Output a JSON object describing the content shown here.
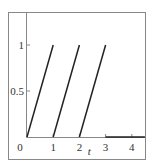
{
  "chart_data": {
    "type": "line",
    "title": "",
    "xlabel": "t",
    "ylabel": "",
    "xlim": [
      0,
      4.5
    ],
    "ylim": [
      0,
      1
    ],
    "xticks": [
      "0",
      "1",
      "2",
      "3",
      "4"
    ],
    "yticks": [
      "0.5",
      "1"
    ],
    "origin_label": "0",
    "grid": false,
    "legend": null,
    "series": [
      {
        "name": "segment-1",
        "x": [
          0,
          1
        ],
        "y": [
          0,
          1
        ]
      },
      {
        "name": "segment-2",
        "x": [
          1,
          2
        ],
        "y": [
          0,
          1
        ]
      },
      {
        "name": "segment-3",
        "x": [
          2,
          3
        ],
        "y": [
          0,
          1
        ]
      },
      {
        "name": "segment-4",
        "x": [
          3,
          4.5
        ],
        "y": [
          0,
          0
        ]
      }
    ]
  }
}
